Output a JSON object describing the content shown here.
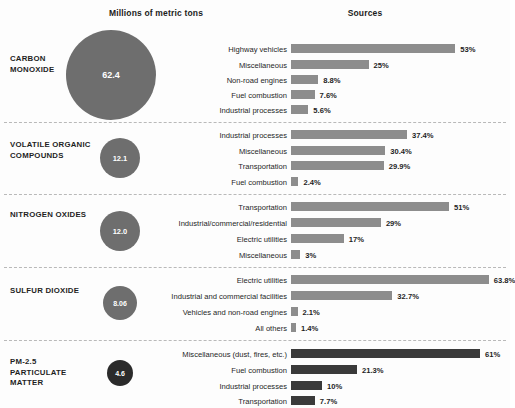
{
  "headers": {
    "left": "Millions of metric tons",
    "right": "Sources"
  },
  "chart_data": {
    "type": "bar",
    "xlabel": "",
    "ylabel": "",
    "units": "percent of total emissions",
    "bubble_units": "millions of metric tons",
    "bar_color": "#8d8d8d",
    "bar_color_dark": "#3a3a3a",
    "bubble_color": "#6e6e6e",
    "bubble_color_dark": "#2b2b2b",
    "xlim": [
      0,
      100
    ],
    "grid": false,
    "legend": "none",
    "sections": [
      {
        "name": "CARBON MONOXIDE",
        "total": "62.4",
        "total_value": 62.4,
        "bubble_px": 90,
        "categories": [
          "Highway vehicles",
          "Miscellaneous",
          "Non-road engines",
          "Fuel combustion",
          "Industrial processes"
        ],
        "values": [
          53,
          25,
          8.8,
          7.6,
          5.6
        ],
        "labels": [
          "53%",
          "25%",
          "8.8%",
          "7.6%",
          "5.6%"
        ]
      },
      {
        "name": "VOLATILE ORGANIC COMPOUNDS",
        "total": "12.1",
        "total_value": 12.1,
        "bubble_px": 40,
        "categories": [
          "Industrial processes",
          "Miscellaneous",
          "Transportation",
          "Fuel combustion"
        ],
        "values": [
          37.4,
          30.4,
          29.9,
          2.4
        ],
        "labels": [
          "37.4%",
          "30.4%",
          "29.9%",
          "2.4%"
        ]
      },
      {
        "name": "NITROGEN OXIDES",
        "total": "12.0",
        "total_value": 12.0,
        "bubble_px": 40,
        "categories": [
          "Transportation",
          "Industrial/commercial/residential",
          "Electric utilities",
          "Miscellaneous"
        ],
        "values": [
          51,
          29,
          17,
          3
        ],
        "labels": [
          "51%",
          "29%",
          "17%",
          "3%"
        ]
      },
      {
        "name": "SULFUR DIOXIDE",
        "total": "8.06",
        "total_value": 8.06,
        "bubble_px": 34,
        "categories": [
          "Electric utilities",
          "Industrial and commercial facilities",
          "Vehicles and non-road engines",
          "All others"
        ],
        "values": [
          63.8,
          32.7,
          2.1,
          1.4
        ],
        "labels": [
          "63.8%",
          "32.7%",
          "2.1%",
          "1.4%"
        ]
      },
      {
        "name": "PM-2.5 PARTICULATE MATTER",
        "total": "4.6",
        "total_value": 4.6,
        "bubble_px": 26,
        "categories": [
          "Miscellaneous (dust, fires, etc.)",
          "Fuel combustion",
          "Industrial processes",
          "Transportation"
        ],
        "values": [
          61,
          21.3,
          10,
          7.7
        ],
        "labels": [
          "61%",
          "21.3%",
          "10%",
          "7.7%"
        ]
      }
    ]
  }
}
